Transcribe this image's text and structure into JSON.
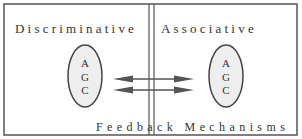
{
  "diagram": {
    "left_panel": {
      "title": "Discriminative",
      "ellipse_letters": [
        "A",
        "G",
        "C"
      ]
    },
    "right_panel": {
      "title": "Associative",
      "ellipse_letters": [
        "A",
        "G",
        "C"
      ]
    },
    "footer_label": "Feedback Mechanisms",
    "arrows": [
      {
        "from": "left",
        "to": "right",
        "style": "double-headed"
      },
      {
        "from": "left",
        "to": "right",
        "style": "double-headed"
      }
    ],
    "colors": {
      "stroke": "#555555",
      "ellipse_fill": "#eeeeee",
      "background": "#ffffff"
    }
  }
}
